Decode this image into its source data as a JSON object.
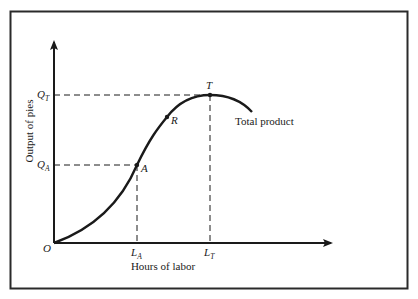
{
  "diagram": {
    "colors": {
      "ink": "#1a1a1a",
      "frame": "#2a2a2a",
      "background": "#ffffff"
    },
    "axes": {
      "x_label": "Hours of labor",
      "y_label": "Output of pies",
      "origin_label": "O"
    },
    "curve": {
      "label": "Total product",
      "shape": "S-shaped rising to maximum at T then declining"
    },
    "points": [
      {
        "id": "A",
        "label": "A",
        "x_label_base": "L",
        "x_label_sub": "A",
        "y_label_base": "Q",
        "y_label_sub": "A",
        "guides": true
      },
      {
        "id": "R",
        "label": "R",
        "guides": false
      },
      {
        "id": "T",
        "label": "T",
        "x_label_base": "L",
        "x_label_sub": "T",
        "y_label_base": "Q",
        "y_label_sub": "T",
        "guides": true
      }
    ]
  }
}
